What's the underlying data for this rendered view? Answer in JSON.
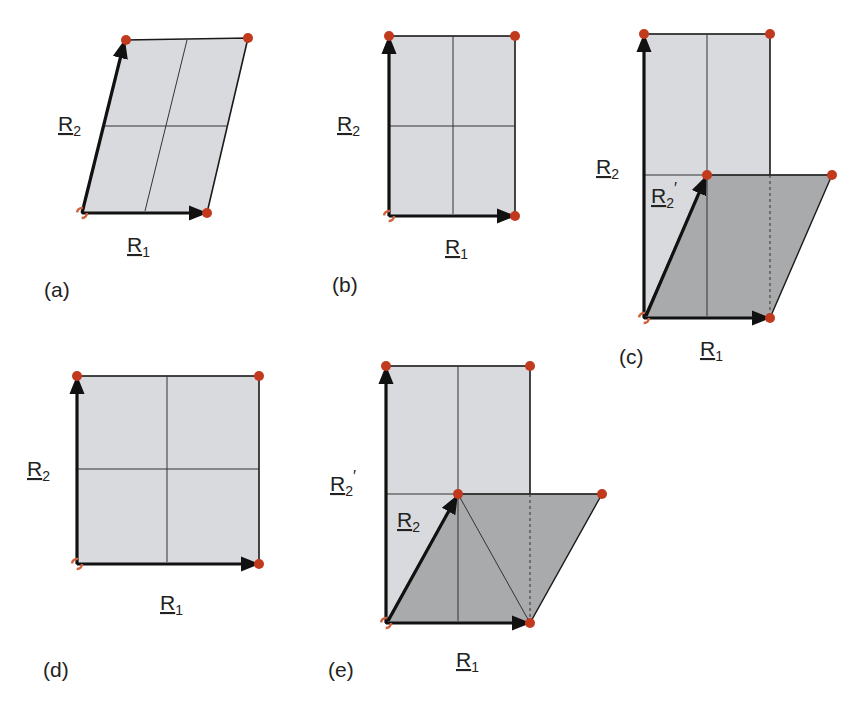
{
  "colors": {
    "light_fill": "#d9dadd",
    "dark_fill": "#a9aaac",
    "line": "#1a1a1a",
    "grid": "#333333",
    "dot": "#c23a1e",
    "dot_open": "#d0603a"
  },
  "panels": [
    {
      "id": "a",
      "caption": "(a)",
      "r1": {
        "base": "R",
        "sub": "1"
      },
      "r2": {
        "base": "R",
        "sub": "2"
      }
    },
    {
      "id": "b",
      "caption": "(b)",
      "r1": {
        "base": "R",
        "sub": "1"
      },
      "r2": {
        "base": "R",
        "sub": "2"
      }
    },
    {
      "id": "c",
      "caption": "(c)",
      "r1": {
        "base": "R",
        "sub": "1"
      },
      "r2": {
        "base": "R",
        "sub": "2"
      },
      "r2p": {
        "base": "R",
        "sub": "2",
        "prime": "′"
      }
    },
    {
      "id": "d",
      "caption": "(d)",
      "r1": {
        "base": "R",
        "sub": "1"
      },
      "r2": {
        "base": "R",
        "sub": "2"
      }
    },
    {
      "id": "e",
      "caption": "(e)",
      "r1": {
        "base": "R",
        "sub": "1"
      },
      "r2": {
        "base": "R",
        "sub": "2"
      },
      "r2p": {
        "base": "R",
        "sub": "2",
        "prime": "′"
      }
    }
  ]
}
